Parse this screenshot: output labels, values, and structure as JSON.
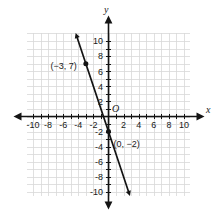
{
  "chart_data": {
    "type": "line",
    "title": "",
    "xlabel": "x",
    "ylabel": "y",
    "origin_label": "O",
    "xlim": [
      -11,
      11
    ],
    "ylim": [
      -11,
      11
    ],
    "grid": true,
    "grid_step": 1,
    "legend": "none",
    "xticks": [
      -10,
      -8,
      -6,
      -4,
      -2,
      2,
      4,
      6,
      8,
      10
    ],
    "yticks": [
      10,
      8,
      6,
      4,
      2,
      -2,
      -4,
      -6,
      -8,
      -10
    ],
    "xtick_labels": [
      "-10",
      "-8",
      "-6",
      "-4",
      "-2",
      "2",
      "4",
      "6",
      "8",
      "10"
    ],
    "ytick_labels": [
      "10",
      "8",
      "6",
      "4",
      "2",
      "-2",
      "-4",
      "-6",
      "-8",
      "-10"
    ],
    "series": [
      {
        "name": "line",
        "slope": -3,
        "intercept": -2,
        "equation": "y = -3x - 2",
        "arrows": "both",
        "x": [
          -3,
          0
        ],
        "y": [
          7,
          -2
        ]
      }
    ],
    "annotations": [
      {
        "label": "(−3, 7)",
        "x": -3,
        "y": 7,
        "marker": true
      },
      {
        "label": "(0, −2)",
        "x": 0,
        "y": -2,
        "marker": true
      }
    ],
    "colors": {
      "grid": "#d8d8d8",
      "axis": "#141414",
      "line": "#141414",
      "point": "#141414",
      "background": "#ffffff"
    }
  }
}
